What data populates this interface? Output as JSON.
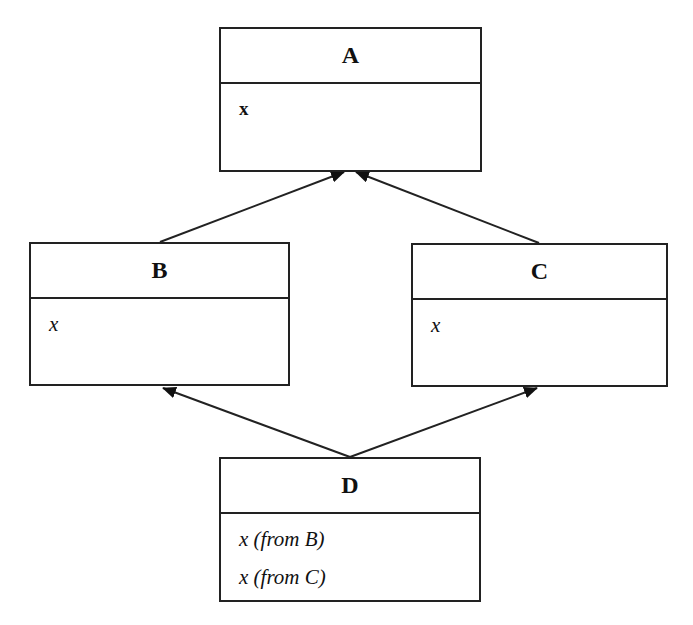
{
  "diagram": {
    "type": "uml-class-diagram",
    "topic": "diamond inheritance",
    "classes": [
      {
        "id": "A",
        "name": "A",
        "attributes": [
          "x"
        ],
        "attribute_style": "upright"
      },
      {
        "id": "B",
        "name": "B",
        "attributes": [
          "x"
        ],
        "attribute_style": "italic"
      },
      {
        "id": "C",
        "name": "C",
        "attributes": [
          "x"
        ],
        "attribute_style": "italic"
      },
      {
        "id": "D",
        "name": "D",
        "attributes": [
          "x (from B)",
          "x (from C)"
        ],
        "attribute_style": "italic"
      }
    ],
    "relations": [
      {
        "from": "B",
        "to": "A",
        "kind": "generalization"
      },
      {
        "from": "C",
        "to": "A",
        "kind": "generalization"
      },
      {
        "from": "D",
        "to": "B",
        "kind": "generalization"
      },
      {
        "from": "D",
        "to": "C",
        "kind": "generalization"
      }
    ],
    "colors": {
      "stroke": "#222222",
      "background": "#ffffff"
    }
  }
}
